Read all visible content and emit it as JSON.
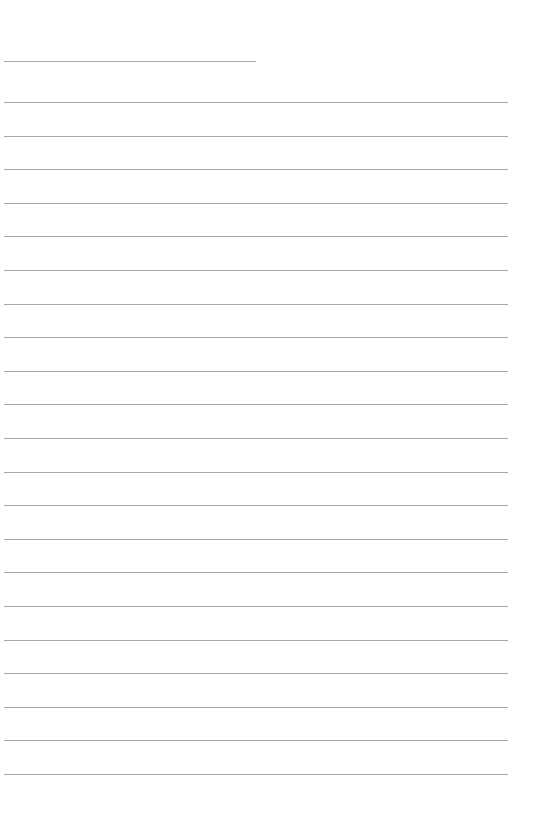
{
  "page": {
    "type": "lined-paper",
    "header_line": {
      "top": 61,
      "width": 252
    },
    "rules": {
      "count": 21,
      "first_top": 102,
      "spacing": 33.6,
      "width": 504
    },
    "line_color": "#9a9a9a",
    "background": "#ffffff"
  }
}
